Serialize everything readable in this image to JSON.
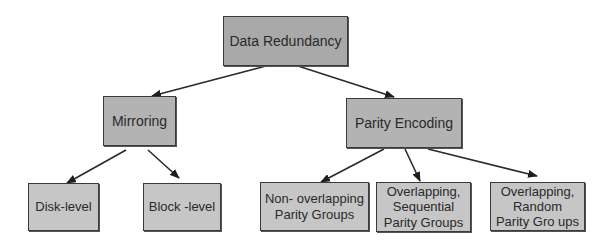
{
  "diagram": {
    "type": "hierarchy-tree",
    "colors": {
      "root_fill": "#a9a9a9",
      "mid_fill": "#b3b3b3",
      "leaf_fill": "#c6c6c6",
      "border": "#3a3a3a",
      "arrow": "#2a2a2a",
      "text": "#2a2a2a"
    },
    "nodes": {
      "root": {
        "label": "Data Redundancy"
      },
      "mirroring": {
        "label": "Mirroring"
      },
      "parity_encoding": {
        "label": "Parity Encoding"
      },
      "disk_level": {
        "label": "Disk-level"
      },
      "block_level": {
        "label": "Block -level"
      },
      "non_overlapping": {
        "label": "Non- overlapping\nParity Groups"
      },
      "overlapping_sequential": {
        "label": "Overlapping,\nSequential\nParity Groups"
      },
      "overlapping_random": {
        "label": "Overlapping,\nRandom\nParity Gro ups"
      }
    },
    "edges": [
      {
        "from": "Data Redundancy",
        "to": "Mirroring"
      },
      {
        "from": "Data Redundancy",
        "to": "Parity Encoding"
      },
      {
        "from": "Mirroring",
        "to": "Disk-level"
      },
      {
        "from": "Mirroring",
        "to": "Block -level"
      },
      {
        "from": "Parity Encoding",
        "to": "Non- overlapping Parity Groups"
      },
      {
        "from": "Parity Encoding",
        "to": "Overlapping, Sequential Parity Groups"
      },
      {
        "from": "Parity Encoding",
        "to": "Overlapping, Random Parity Gro ups"
      }
    ]
  }
}
